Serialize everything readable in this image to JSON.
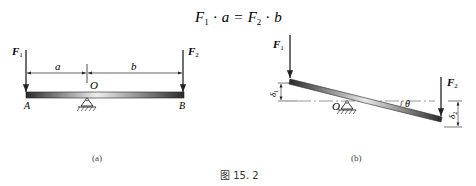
{
  "equation": {
    "F1": "F",
    "F1_sub": "1",
    "dot1": "·",
    "a": "a",
    "eq": "=",
    "F2": "F",
    "F2_sub": "2",
    "dot2": "·",
    "b": "b"
  },
  "figure_a": {
    "label": "(a)",
    "force_left": {
      "symbol": "F",
      "sub": "1"
    },
    "force_right": {
      "symbol": "F",
      "sub": "2"
    },
    "dim_a": "a",
    "dim_b": "b",
    "pivot": "O",
    "end_left": "A",
    "end_right": "B"
  },
  "figure_b": {
    "label": "(b)",
    "force_left": {
      "symbol": "F",
      "sub": "1"
    },
    "force_right": {
      "symbol": "F",
      "sub": "2"
    },
    "pivot": "O",
    "angle": "θ",
    "delta_left": {
      "symbol": "δ",
      "sub": "1"
    },
    "delta_right": {
      "symbol": "δ",
      "sub": "2"
    }
  },
  "caption": "图 15. 2",
  "colors": {
    "beam_dark": "#333333",
    "beam_light": "#e0e0e0",
    "line": "#222222"
  }
}
